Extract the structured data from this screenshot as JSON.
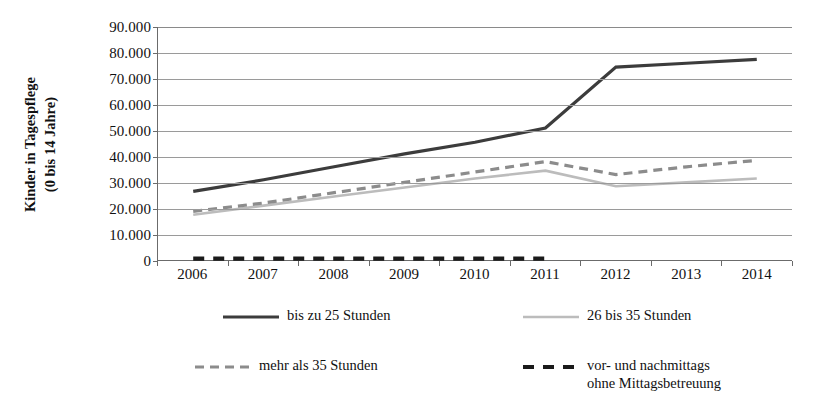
{
  "axis": {
    "y_title_line1": "Kinder in Tagespflege",
    "y_title_line2": "(0 bis 14 Jahre)",
    "y_ticks": [
      "90.000",
      "80.000",
      "70.000",
      "60.000",
      "50.000",
      "40.000",
      "30.000",
      "20.000",
      "10.000",
      "0"
    ]
  },
  "legend": {
    "items": [
      {
        "label": "bis zu 25 Stunden",
        "style": "solid",
        "color": "#3c3c3c",
        "width": 3.2
      },
      {
        "label": "26 bis 35 Stunden",
        "style": "solid",
        "color": "#bcbcbc",
        "width": 2.6
      },
      {
        "label": "mehr als 35 Stunden",
        "style": "dashed",
        "color": "#8c8c8c",
        "width": 3.2
      },
      {
        "label": "vor- und nachmittags\nohne Mittagsbetreuung",
        "style": "dashed",
        "color": "#1a1a1a",
        "width": 4.0
      }
    ]
  },
  "chart_data": {
    "type": "line",
    "title": "",
    "xlabel": "",
    "ylabel": "Kinder in Tagespflege (0 bis 14 Jahre)",
    "ylim": [
      0,
      90000
    ],
    "ytick_step": 10000,
    "grid": true,
    "legend_position": "bottom",
    "categories": [
      "2006",
      "2007",
      "2008",
      "2009",
      "2010",
      "2011",
      "2012",
      "2013",
      "2014"
    ],
    "series": [
      {
        "name": "bis zu 25 Stunden",
        "color": "#3c3c3c",
        "dash": "solid",
        "values": [
          26500,
          31000,
          36000,
          41000,
          45500,
          51000,
          74500,
          76000,
          77500
        ]
      },
      {
        "name": "26 bis 35 Stunden",
        "color": "#bcbcbc",
        "dash": "solid",
        "values": [
          17500,
          21000,
          24500,
          28000,
          31500,
          34500,
          28500,
          30000,
          31500
        ]
      },
      {
        "name": "mehr als 35 Stunden",
        "color": "#8c8c8c",
        "dash": "dashed",
        "values": [
          18800,
          22000,
          26000,
          30000,
          34000,
          38000,
          33000,
          36000,
          38500
        ]
      },
      {
        "name": "vor- und nachmittags ohne Mittagsbetreuung",
        "color": "#1a1a1a",
        "dash": "dashed",
        "values": [
          500,
          500,
          500,
          500,
          500,
          500,
          null,
          null,
          null
        ]
      }
    ]
  }
}
